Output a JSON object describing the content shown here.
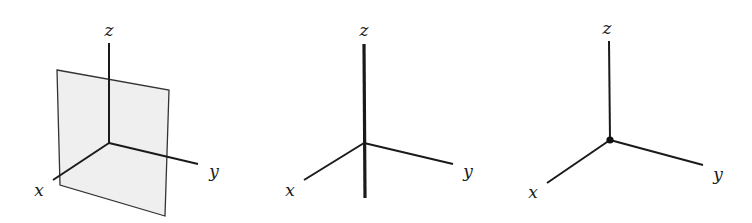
{
  "colors": {
    "stroke": "#1a1a1a",
    "plane_fill": "#efefef",
    "plane_stroke": "#333333"
  },
  "diagrams": [
    {
      "id": "plane",
      "description": "coordinate axes with a plane",
      "labels": {
        "x": "x",
        "y": "y",
        "z": "z"
      }
    },
    {
      "id": "line",
      "description": "coordinate axes with a line along the z-axis",
      "labels": {
        "x": "x",
        "y": "y",
        "z": "z"
      }
    },
    {
      "id": "point",
      "description": "coordinate axes with a point at the origin",
      "labels": {
        "x": "x",
        "y": "y",
        "z": "z"
      }
    }
  ]
}
